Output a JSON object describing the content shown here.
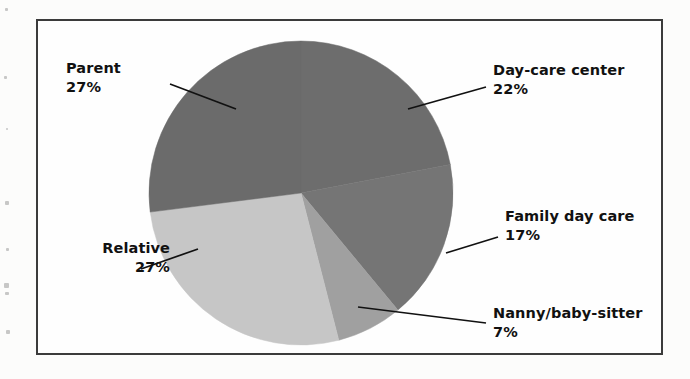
{
  "figure": {
    "frame_border_color": "#3b3b3b",
    "background_color": "#fefefe"
  },
  "chart_data": {
    "type": "pie",
    "title": "",
    "subtitle": "",
    "xlabel": "",
    "ylabel": "",
    "grid": false,
    "legend_position": "none",
    "labels_position": "outside-with-leader-lines",
    "start_angle_deg": 0,
    "direction": "clockwise",
    "total_percent": 100,
    "categories": [
      "Day-care center",
      "Family day care",
      "Nanny/baby-sitter",
      "Relative",
      "Parent"
    ],
    "values": [
      22,
      17,
      7,
      27,
      27
    ],
    "value_unit": "%",
    "slices": [
      {
        "label": "Day-care center",
        "value": 22,
        "value_text": "22%",
        "color": "#6d6d6d",
        "start_angle_deg": 0,
        "end_angle_deg": 79.2
      },
      {
        "label": "Family day care",
        "value": 17,
        "value_text": "17%",
        "color": "#757575",
        "start_angle_deg": 79.2,
        "end_angle_deg": 140.4
      },
      {
        "label": "Nanny/baby-sitter",
        "value": 7,
        "value_text": "7%",
        "color": "#a0a0a0",
        "start_angle_deg": 140.4,
        "end_angle_deg": 165.6
      },
      {
        "label": "Relative",
        "value": 27,
        "value_text": "27%",
        "color": "#c6c6c6",
        "start_angle_deg": 165.6,
        "end_angle_deg": 262.8
      },
      {
        "label": "Parent",
        "value": 27,
        "value_text": "27%",
        "color": "#6b6b6b",
        "start_angle_deg": 262.8,
        "end_angle_deg": 360
      }
    ]
  },
  "labels": {
    "parent": {
      "name": "Parent",
      "percent": "27%"
    },
    "daycare": {
      "name": "Day-care center",
      "percent": "22%"
    },
    "family": {
      "name": "Family day care",
      "percent": "17%"
    },
    "nanny": {
      "name": "Nanny/baby-sitter",
      "percent": "7%"
    },
    "relative": {
      "name": "Relative",
      "percent": "27%"
    }
  }
}
